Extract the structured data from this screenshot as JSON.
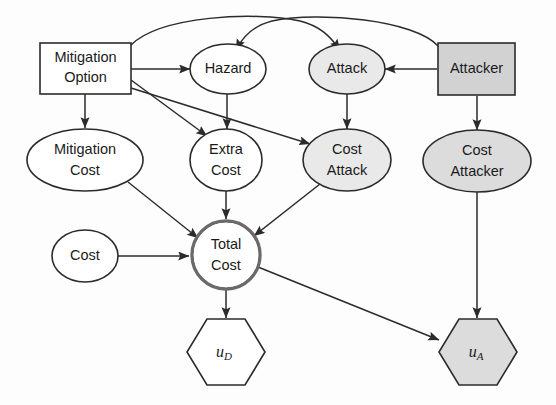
{
  "diagram": {
    "background_color": "#fdfdfd",
    "stroke_color": "#2b2b2b",
    "nodes": [
      {
        "id": "mitigation_option",
        "label_line1": "Mitigation",
        "label_line2": "Option",
        "shape": "rectangle",
        "role": "decision",
        "fill": "#ffffff",
        "cx": 85,
        "cy": 68
      },
      {
        "id": "hazard",
        "label_line1": "Hazard",
        "label_line2": "",
        "shape": "ellipse",
        "role": "chance",
        "fill": "#ffffff",
        "cx": 228,
        "cy": 69
      },
      {
        "id": "attack",
        "label_line1": "Attack",
        "label_line2": "",
        "shape": "ellipse",
        "role": "chance",
        "fill": "#e9e9e9",
        "cx": 347,
        "cy": 69
      },
      {
        "id": "attacker",
        "label_line1": "Attacker",
        "label_line2": "",
        "shape": "rectangle",
        "role": "decision",
        "fill": "#d2d2d2",
        "cx": 476,
        "cy": 69
      },
      {
        "id": "mitigation_cost",
        "label_line1": "Mitigation",
        "label_line2": "Cost",
        "shape": "ellipse",
        "role": "chance",
        "fill": "#ffffff",
        "cx": 85,
        "cy": 160
      },
      {
        "id": "extra_cost",
        "label_line1": "Extra",
        "label_line2": "Cost",
        "shape": "ellipse",
        "role": "chance",
        "fill": "#ffffff",
        "cx": 226,
        "cy": 160
      },
      {
        "id": "cost_attack",
        "label_line1": "Cost",
        "label_line2": "Attack",
        "shape": "ellipse",
        "role": "chance",
        "fill": "#e9e9e9",
        "cx": 347,
        "cy": 160
      },
      {
        "id": "cost_attacker",
        "label_line1": "Cost",
        "label_line2": "Attacker",
        "shape": "ellipse",
        "role": "chance",
        "fill": "#dcdcdc",
        "cx": 477,
        "cy": 161
      },
      {
        "id": "cost",
        "label_line1": "Cost",
        "label_line2": "",
        "shape": "ellipse",
        "role": "chance",
        "fill": "#ffffff",
        "cx": 85,
        "cy": 256
      },
      {
        "id": "total_cost",
        "label_line1": "Total",
        "label_line2": "Cost",
        "shape": "circle-double",
        "role": "deterministic",
        "fill": "#ffffff",
        "cx": 226,
        "cy": 255
      },
      {
        "id": "u_d",
        "label_line1": "u",
        "label_line2": "D",
        "shape": "hexagon",
        "role": "utility",
        "fill": "#ffffff",
        "cx": 226,
        "cy": 352
      },
      {
        "id": "u_a",
        "label_line1": "u",
        "label_line2": "A",
        "shape": "hexagon",
        "role": "utility",
        "fill": "#dcdcdc",
        "cx": 478,
        "cy": 352
      }
    ],
    "edges": [
      {
        "from": "mitigation_option",
        "to": "attack",
        "style": "curved"
      },
      {
        "from": "attacker",
        "to": "hazard",
        "style": "curved"
      },
      {
        "from": "mitigation_option",
        "to": "hazard",
        "style": "straight"
      },
      {
        "from": "mitigation_option",
        "to": "mitigation_cost",
        "style": "straight"
      },
      {
        "from": "mitigation_option",
        "to": "extra_cost",
        "style": "straight"
      },
      {
        "from": "mitigation_option",
        "to": "cost_attack",
        "style": "straight"
      },
      {
        "from": "attacker",
        "to": "attack",
        "style": "straight"
      },
      {
        "from": "attacker",
        "to": "cost_attacker",
        "style": "straight"
      },
      {
        "from": "hazard",
        "to": "extra_cost",
        "style": "straight"
      },
      {
        "from": "attack",
        "to": "cost_attack",
        "style": "straight"
      },
      {
        "from": "mitigation_cost",
        "to": "total_cost",
        "style": "straight"
      },
      {
        "from": "extra_cost",
        "to": "total_cost",
        "style": "straight"
      },
      {
        "from": "cost_attack",
        "to": "total_cost",
        "style": "straight"
      },
      {
        "from": "cost",
        "to": "total_cost",
        "style": "straight"
      },
      {
        "from": "total_cost",
        "to": "u_d",
        "style": "straight"
      },
      {
        "from": "total_cost",
        "to": "u_a",
        "style": "straight"
      },
      {
        "from": "cost_attacker",
        "to": "u_a",
        "style": "straight"
      }
    ]
  }
}
